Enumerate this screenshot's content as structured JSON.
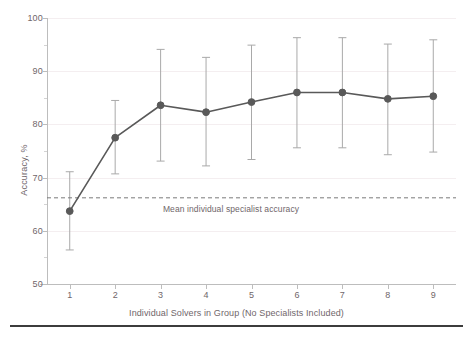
{
  "chart_data": {
    "type": "line",
    "title": "",
    "subtitle": "",
    "xlabel": "Individual Solvers in Group (No Specialists Included)",
    "ylabel": "Accuracy, %",
    "x": [
      1,
      2,
      3,
      4,
      5,
      6,
      7,
      8,
      9
    ],
    "categories": [
      "1",
      "2",
      "3",
      "4",
      "5",
      "6",
      "7",
      "8",
      "9"
    ],
    "values": [
      63.7,
      77.5,
      83.6,
      82.3,
      84.2,
      86.0,
      86.0,
      84.8,
      85.3
    ],
    "error_low": [
      56.4,
      70.7,
      73.1,
      72.2,
      73.4,
      75.6,
      75.6,
      74.3,
      74.8
    ],
    "error_high": [
      71.1,
      84.5,
      94.1,
      92.6,
      94.9,
      96.3,
      96.3,
      95.1,
      95.9
    ],
    "xlim": [
      0.5,
      9.5
    ],
    "ylim": [
      50,
      100
    ],
    "ytick_labels": [
      "50",
      "60",
      "70",
      "80",
      "90",
      "100"
    ],
    "yticks": [
      50,
      60,
      70,
      80,
      90,
      100
    ],
    "yminor_ticks": [
      55,
      65,
      75,
      85,
      95
    ],
    "grid": true,
    "grid_axis": "y",
    "legend": "none",
    "series": [
      {
        "name": "Group accuracy",
        "values": [
          63.7,
          77.5,
          83.6,
          82.3,
          84.2,
          86.0,
          86.0,
          84.8,
          85.3
        ]
      }
    ],
    "reference_line": {
      "value": 66.2,
      "label": "Mean individual specialist accuracy",
      "style": "dashed",
      "orientation": "horizontal"
    },
    "colors": {
      "marker": "#595959",
      "line": "#595959",
      "errorbar": "#a9a9a9",
      "grid": "#f4eef0",
      "axis": "#bdbdbd",
      "text": "#70666a",
      "reference_line": "#7a7a7a",
      "bottom_rule": "#3c3c3c",
      "background": "#ffffff"
    }
  }
}
